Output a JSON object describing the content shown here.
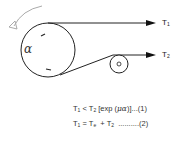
{
  "diagram": {
    "labels": {
      "t1": {
        "base": "T",
        "sub": "1"
      },
      "t2": {
        "base": "T",
        "sub": "2"
      },
      "angle": "α"
    },
    "equations": [
      {
        "pre": "T",
        "pre_sub": "1",
        "mid": " < T",
        "mid_sub": "2",
        "post": " [exp (",
        "mu_alpha": "μα",
        "tail": ")]...(1)"
      },
      {
        "pre": "T",
        "pre_sub": "1",
        "mid": " = T",
        "mid_sub": "e",
        "post": "  + T",
        "post_sub": "2",
        "tail": "  ..........(2)"
      }
    ],
    "colors": {
      "line": "#222222",
      "rotation_arrow": "#aaaaaa"
    }
  }
}
